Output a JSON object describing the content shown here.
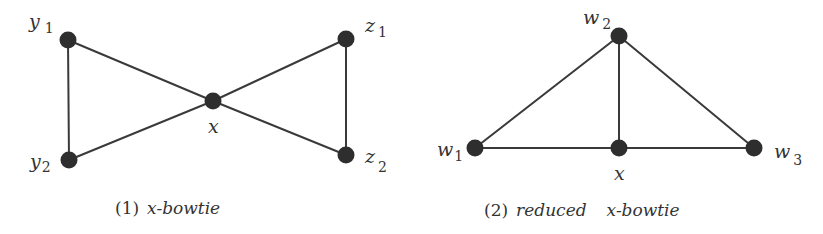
{
  "figure1": {
    "caption_num": "(1)",
    "caption_var": "x",
    "caption_text": "-bowtie",
    "nodes": [
      {
        "id": "y1",
        "base": "y",
        "sub": "1",
        "cx": 68,
        "cy": 40
      },
      {
        "id": "y2",
        "base": "y",
        "sub": "2",
        "cx": 69,
        "cy": 160
      },
      {
        "id": "x",
        "base": "x",
        "sub": "",
        "cx": 213,
        "cy": 101
      },
      {
        "id": "z1",
        "base": "z",
        "sub": "1",
        "cx": 346,
        "cy": 39
      },
      {
        "id": "z2",
        "base": "z",
        "sub": "2",
        "cx": 346,
        "cy": 155
      }
    ],
    "edges": [
      [
        "y1",
        "y2"
      ],
      [
        "y1",
        "x"
      ],
      [
        "y2",
        "x"
      ],
      [
        "x",
        "z1"
      ],
      [
        "x",
        "z2"
      ],
      [
        "z1",
        "z2"
      ]
    ]
  },
  "figure2": {
    "caption_num": "(2)",
    "caption_word": "reduced",
    "caption_var": "x",
    "caption_text": "-bowtie",
    "nodes": [
      {
        "id": "w1",
        "base": "w",
        "sub": "1",
        "cx": 475,
        "cy": 148
      },
      {
        "id": "w2",
        "base": "w",
        "sub": "2",
        "cx": 619,
        "cy": 36
      },
      {
        "id": "w3",
        "base": "w",
        "sub": "3",
        "cx": 754,
        "cy": 148
      },
      {
        "id": "x",
        "base": "x",
        "sub": "",
        "cx": 619,
        "cy": 148
      }
    ],
    "edges": [
      [
        "w1",
        "w2"
      ],
      [
        "w2",
        "w3"
      ],
      [
        "w2",
        "x"
      ],
      [
        "w1",
        "x"
      ],
      [
        "x",
        "w3"
      ]
    ]
  },
  "colors": {
    "node": "#2e2e2e",
    "edge": "#3a3a3a",
    "text": "#333333",
    "background": "#ffffff"
  }
}
